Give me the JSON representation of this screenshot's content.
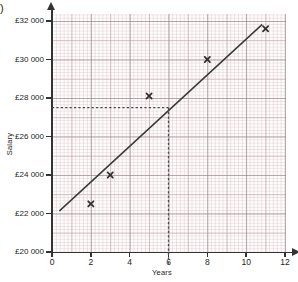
{
  "question_marker": ")",
  "chart_data": {
    "type": "scatter",
    "title": "",
    "xlabel": "Years",
    "ylabel": "Salary",
    "xlim": [
      0,
      12
    ],
    "ylim": [
      20000,
      32000
    ],
    "grid": true,
    "grid_style": "graph-paper",
    "legend": "none",
    "x_ticks": [
      {
        "value": 0,
        "label": "0"
      },
      {
        "value": 2,
        "label": "2"
      },
      {
        "value": 4,
        "label": "4"
      },
      {
        "value": 6,
        "label": "6"
      },
      {
        "value": 8,
        "label": "8"
      },
      {
        "value": 10,
        "label": "10"
      },
      {
        "value": 12,
        "label": "12"
      }
    ],
    "y_ticks": [
      {
        "value": 20000,
        "label": "£20 000"
      },
      {
        "value": 22000,
        "label": "£22 000"
      },
      {
        "value": 24000,
        "label": "£24 000"
      },
      {
        "value": 26000,
        "label": "£26 000"
      },
      {
        "value": 28000,
        "label": "£28 000"
      },
      {
        "value": 30000,
        "label": "£30 000"
      },
      {
        "value": 32000,
        "label": "£32 000"
      }
    ],
    "points": [
      {
        "x": 2,
        "y": 22500
      },
      {
        "x": 3,
        "y": 24000
      },
      {
        "x": 5,
        "y": 28100
      },
      {
        "x": 8,
        "y": 30000
      },
      {
        "x": 11,
        "y": 31600
      }
    ],
    "marker_symbol": "x",
    "line_of_best_fit": {
      "x_start": 0.4,
      "y_start": 22150,
      "x_end": 10.8,
      "y_end": 31800,
      "style": "solid"
    },
    "construction_lines": {
      "style": "dashed",
      "vertical_x": 6,
      "horizontal_y": 27500,
      "reading_x": "6",
      "reading_y": "£27 500"
    },
    "colors": {
      "axis": "#333333",
      "marker": "#2e2e2e",
      "trend": "#3a3a3a",
      "dashed": "#4a4a4a",
      "grid_minor": "#c4969e",
      "grid_major": "#787880"
    }
  }
}
